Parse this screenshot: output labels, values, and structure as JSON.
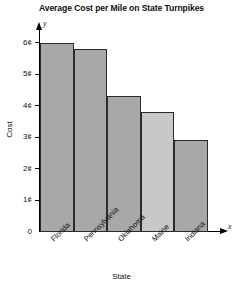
{
  "chart_data": {
    "type": "bar",
    "title": "Average Cost per Mile on State Turnpikes",
    "xlabel": "State",
    "ylabel": "Cost",
    "x_axis_variable": "x",
    "y_axis_variable": "y",
    "categories": [
      "Florida",
      "Pennsylvania",
      "Oklahoma",
      "Maine",
      "Indiana"
    ],
    "values": [
      6.0,
      5.8,
      4.3,
      3.8,
      2.9
    ],
    "value_unit": "¢",
    "ylim": [
      0,
      6.6
    ],
    "ytick_values": [
      0,
      1,
      2,
      3,
      4,
      5,
      6
    ],
    "ytick_labels": [
      "0",
      "1¢",
      "2¢",
      "3¢",
      "4¢",
      "5¢",
      "6¢"
    ],
    "grid": false,
    "legend": "none",
    "bar_colors": [
      "#a8a8a8",
      "#a8a8a8",
      "#a8a8a8",
      "#c8c8c8",
      "#a8a8a8"
    ],
    "bar_edge_color": "#2b2b2b",
    "background_color": "#ffffff",
    "axis_color": "#000000"
  }
}
